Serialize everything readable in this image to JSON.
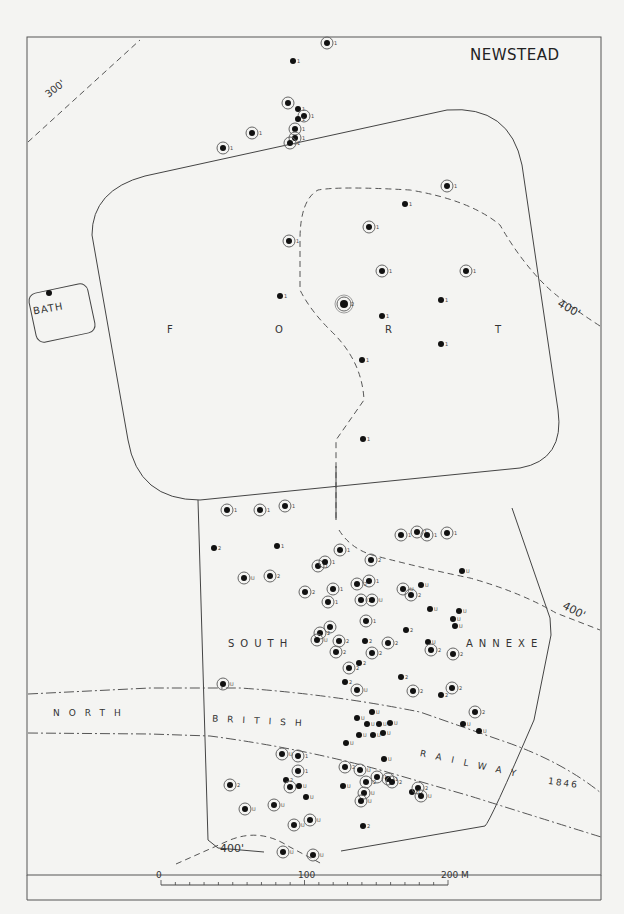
{
  "map": {
    "title": "NEWSTEAD",
    "labels": {
      "bath": "BATH",
      "fort_letters": [
        "F",
        "O",
        "R",
        "T"
      ],
      "south": "SOUTH",
      "annexe": "ANNEXE",
      "railway_north": "NORTH",
      "railway_british": "BRITISH",
      "railway_railway": "RAILWAY",
      "railway_year": "1846"
    },
    "contours": [
      {
        "label": "300'",
        "style": "dashed"
      },
      {
        "label": "400'",
        "style": "dashed",
        "position": "east-fort"
      },
      {
        "label": "400'",
        "style": "dashed",
        "position": "east-annexe"
      },
      {
        "label": "400'",
        "style": "dashed",
        "position": "south"
      }
    ],
    "scale_bar": {
      "ticks": [
        "0",
        "100",
        "200 M"
      ],
      "unit": "M",
      "max": 200
    },
    "legend_codes": [
      "1",
      "2",
      "U",
      "S"
    ],
    "colors": {
      "background": "#f4f4f2",
      "ink": "#222222",
      "frame": "#444444"
    }
  },
  "chart_data": {
    "type": "map",
    "title": "NEWSTEAD",
    "regions": [
      "BATH",
      "FORT",
      "SOUTH ANNEXE"
    ],
    "features": [
      "NORTH BRITISH RAILWAY 1846",
      "300' contour",
      "400' contour"
    ],
    "scale": {
      "min": 0,
      "mid": 100,
      "max": 200,
      "unit": "M"
    },
    "points": [
      {
        "x": 327,
        "y": 43,
        "code": "1",
        "ring": true
      },
      {
        "x": 293,
        "y": 61,
        "code": "1",
        "ring": false
      },
      {
        "x": 288,
        "y": 103,
        "code": "",
        "ring": true
      },
      {
        "x": 298,
        "y": 109,
        "code": "1",
        "ring": false
      },
      {
        "x": 304,
        "y": 116,
        "code": "1",
        "ring": true
      },
      {
        "x": 298,
        "y": 119,
        "code": "1",
        "ring": false
      },
      {
        "x": 295,
        "y": 129,
        "code": "1",
        "ring": true
      },
      {
        "x": 295,
        "y": 138,
        "code": "1",
        "ring": true
      },
      {
        "x": 252,
        "y": 133,
        "code": "1",
        "ring": true
      },
      {
        "x": 290,
        "y": 143,
        "code": "1",
        "ring": true
      },
      {
        "x": 223,
        "y": 148,
        "code": "1",
        "ring": true
      },
      {
        "x": 447,
        "y": 186,
        "code": "1",
        "ring": true
      },
      {
        "x": 405,
        "y": 204,
        "code": "1",
        "ring": false
      },
      {
        "x": 369,
        "y": 227,
        "code": "1",
        "ring": true
      },
      {
        "x": 289,
        "y": 241,
        "code": "1",
        "ring": true
      },
      {
        "x": 382,
        "y": 271,
        "code": "1",
        "ring": true
      },
      {
        "x": 466,
        "y": 271,
        "code": "1",
        "ring": true
      },
      {
        "x": 49,
        "y": 293,
        "code": "",
        "ring": false
      },
      {
        "x": 280,
        "y": 296,
        "code": "1",
        "ring": false
      },
      {
        "x": 344,
        "y": 304,
        "code": "2",
        "ring": true,
        "large": true
      },
      {
        "x": 441,
        "y": 300,
        "code": "1",
        "ring": false
      },
      {
        "x": 382,
        "y": 316,
        "code": "1",
        "ring": false
      },
      {
        "x": 441,
        "y": 344,
        "code": "1",
        "ring": false
      },
      {
        "x": 362,
        "y": 360,
        "code": "1",
        "ring": false
      },
      {
        "x": 363,
        "y": 439,
        "code": "1",
        "ring": false
      },
      {
        "x": 227,
        "y": 510,
        "code": "1",
        "ring": true
      },
      {
        "x": 260,
        "y": 510,
        "code": "1",
        "ring": true
      },
      {
        "x": 285,
        "y": 506,
        "code": "1",
        "ring": true
      },
      {
        "x": 401,
        "y": 535,
        "code": "1",
        "ring": true
      },
      {
        "x": 417,
        "y": 532,
        "code": "1",
        "ring": true
      },
      {
        "x": 427,
        "y": 535,
        "code": "1",
        "ring": true
      },
      {
        "x": 447,
        "y": 533,
        "code": "1",
        "ring": true
      },
      {
        "x": 214,
        "y": 548,
        "code": "2",
        "ring": false
      },
      {
        "x": 277,
        "y": 546,
        "code": "1",
        "ring": false
      },
      {
        "x": 340,
        "y": 550,
        "code": "1",
        "ring": true
      },
      {
        "x": 371,
        "y": 560,
        "code": "2",
        "ring": true
      },
      {
        "x": 318,
        "y": 566,
        "code": "1",
        "ring": true
      },
      {
        "x": 325,
        "y": 562,
        "code": "1",
        "ring": true
      },
      {
        "x": 462,
        "y": 571,
        "code": "U",
        "ring": false
      },
      {
        "x": 244,
        "y": 578,
        "code": "U",
        "ring": true
      },
      {
        "x": 270,
        "y": 576,
        "code": "2",
        "ring": true
      },
      {
        "x": 357,
        "y": 584,
        "code": "2",
        "ring": true
      },
      {
        "x": 369,
        "y": 581,
        "code": "1",
        "ring": true
      },
      {
        "x": 333,
        "y": 589,
        "code": "1",
        "ring": true
      },
      {
        "x": 305,
        "y": 592,
        "code": "2",
        "ring": true
      },
      {
        "x": 403,
        "y": 589,
        "code": "U",
        "ring": true
      },
      {
        "x": 421,
        "y": 585,
        "code": "U",
        "ring": false
      },
      {
        "x": 411,
        "y": 595,
        "code": "2",
        "ring": true
      },
      {
        "x": 328,
        "y": 602,
        "code": "1",
        "ring": true
      },
      {
        "x": 361,
        "y": 600,
        "code": "1",
        "ring": true
      },
      {
        "x": 372,
        "y": 600,
        "code": "U",
        "ring": true
      },
      {
        "x": 430,
        "y": 609,
        "code": "U",
        "ring": false
      },
      {
        "x": 459,
        "y": 611,
        "code": "U",
        "ring": false
      },
      {
        "x": 453,
        "y": 619,
        "code": "U",
        "ring": false
      },
      {
        "x": 455,
        "y": 626,
        "code": "U",
        "ring": false
      },
      {
        "x": 366,
        "y": 621,
        "code": "1",
        "ring": true
      },
      {
        "x": 406,
        "y": 630,
        "code": "2",
        "ring": false
      },
      {
        "x": 330,
        "y": 627,
        "code": "",
        "ring": true
      },
      {
        "x": 320,
        "y": 633,
        "code": "2",
        "ring": true
      },
      {
        "x": 317,
        "y": 640,
        "code": "U",
        "ring": true
      },
      {
        "x": 339,
        "y": 641,
        "code": "2",
        "ring": true
      },
      {
        "x": 365,
        "y": 641,
        "code": "2",
        "ring": false
      },
      {
        "x": 388,
        "y": 643,
        "code": "2",
        "ring": true
      },
      {
        "x": 428,
        "y": 642,
        "code": "U",
        "ring": false
      },
      {
        "x": 431,
        "y": 650,
        "code": "2",
        "ring": true
      },
      {
        "x": 453,
        "y": 654,
        "code": "2",
        "ring": true
      },
      {
        "x": 336,
        "y": 652,
        "code": "2",
        "ring": true
      },
      {
        "x": 372,
        "y": 653,
        "code": "2",
        "ring": true
      },
      {
        "x": 359,
        "y": 663,
        "code": "2",
        "ring": false
      },
      {
        "x": 349,
        "y": 668,
        "code": "2",
        "ring": true
      },
      {
        "x": 345,
        "y": 682,
        "code": "2",
        "ring": false
      },
      {
        "x": 401,
        "y": 677,
        "code": "2",
        "ring": false
      },
      {
        "x": 223,
        "y": 684,
        "code": "U",
        "ring": true
      },
      {
        "x": 357,
        "y": 690,
        "code": "U",
        "ring": true
      },
      {
        "x": 413,
        "y": 691,
        "code": "2",
        "ring": true
      },
      {
        "x": 452,
        "y": 688,
        "code": "2",
        "ring": true
      },
      {
        "x": 441,
        "y": 695,
        "code": "2",
        "ring": false
      },
      {
        "x": 372,
        "y": 712,
        "code": "U",
        "ring": false
      },
      {
        "x": 475,
        "y": 712,
        "code": "2",
        "ring": true
      },
      {
        "x": 357,
        "y": 718,
        "code": "U",
        "ring": false
      },
      {
        "x": 367,
        "y": 724,
        "code": "U",
        "ring": false
      },
      {
        "x": 379,
        "y": 724,
        "code": "U",
        "ring": false
      },
      {
        "x": 390,
        "y": 723,
        "code": "U",
        "ring": false
      },
      {
        "x": 463,
        "y": 724,
        "code": "U",
        "ring": false
      },
      {
        "x": 479,
        "y": 731,
        "code": "U",
        "ring": false
      },
      {
        "x": 359,
        "y": 735,
        "code": "U",
        "ring": false
      },
      {
        "x": 373,
        "y": 735,
        "code": "U",
        "ring": false
      },
      {
        "x": 383,
        "y": 733,
        "code": "U",
        "ring": false
      },
      {
        "x": 346,
        "y": 743,
        "code": "U",
        "ring": false
      },
      {
        "x": 282,
        "y": 754,
        "code": "U",
        "ring": true
      },
      {
        "x": 298,
        "y": 756,
        "code": "1",
        "ring": true
      },
      {
        "x": 384,
        "y": 759,
        "code": "U",
        "ring": false
      },
      {
        "x": 345,
        "y": 767,
        "code": "2",
        "ring": true
      },
      {
        "x": 360,
        "y": 770,
        "code": "U",
        "ring": true
      },
      {
        "x": 298,
        "y": 771,
        "code": "1",
        "ring": true
      },
      {
        "x": 286,
        "y": 780,
        "code": "2",
        "ring": false
      },
      {
        "x": 230,
        "y": 785,
        "code": "2",
        "ring": true
      },
      {
        "x": 343,
        "y": 786,
        "code": "U",
        "ring": false
      },
      {
        "x": 366,
        "y": 782,
        "code": "2",
        "ring": true
      },
      {
        "x": 377,
        "y": 777,
        "code": "1",
        "ring": true
      },
      {
        "x": 388,
        "y": 779,
        "code": "1",
        "ring": true
      },
      {
        "x": 392,
        "y": 782,
        "code": "2",
        "ring": true
      },
      {
        "x": 290,
        "y": 787,
        "code": "U",
        "ring": true
      },
      {
        "x": 299,
        "y": 786,
        "code": "U",
        "ring": false
      },
      {
        "x": 364,
        "y": 793,
        "code": "U",
        "ring": true
      },
      {
        "x": 412,
        "y": 792,
        "code": "U",
        "ring": false
      },
      {
        "x": 418,
        "y": 788,
        "code": "2",
        "ring": true
      },
      {
        "x": 421,
        "y": 796,
        "code": "U",
        "ring": true
      },
      {
        "x": 306,
        "y": 797,
        "code": "U",
        "ring": false
      },
      {
        "x": 361,
        "y": 801,
        "code": "U",
        "ring": true
      },
      {
        "x": 274,
        "y": 805,
        "code": "U",
        "ring": true
      },
      {
        "x": 245,
        "y": 809,
        "code": "U",
        "ring": true
      },
      {
        "x": 310,
        "y": 820,
        "code": "U",
        "ring": true
      },
      {
        "x": 294,
        "y": 825,
        "code": "U",
        "ring": true
      },
      {
        "x": 363,
        "y": 826,
        "code": "2",
        "ring": false
      },
      {
        "x": 283,
        "y": 852,
        "code": "U",
        "ring": true
      },
      {
        "x": 313,
        "y": 855,
        "code": "U",
        "ring": true
      }
    ]
  }
}
